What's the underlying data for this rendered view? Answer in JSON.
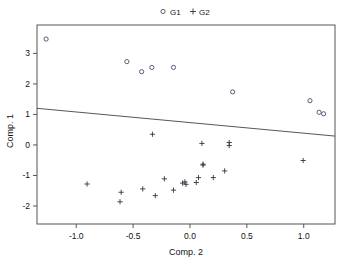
{
  "chart_data": {
    "type": "scatter",
    "title": "",
    "xlabel": "Comp. 2",
    "ylabel": "Comp. 1",
    "xlim": [
      -1.345,
      1.275
    ],
    "ylim": [
      -2.59,
      3.93
    ],
    "xticks": [
      -1.0,
      -0.5,
      0.0,
      0.5,
      1.0
    ],
    "xticklabels": [
      "-1.0",
      "-0.5",
      "0.0",
      "0.5",
      "1.0"
    ],
    "yticks": [
      -2,
      -1,
      0,
      1,
      2,
      3
    ],
    "yticklabels": [
      "-2",
      "-1",
      "0",
      "1",
      "2",
      "3"
    ],
    "grid": false,
    "legend_position": "top",
    "legend": [
      {
        "label": "G1",
        "marker": "circle"
      },
      {
        "label": "G2",
        "marker": "plus"
      }
    ],
    "series": [
      {
        "name": "G1",
        "marker": "circle",
        "points": [
          {
            "x": -1.265,
            "y": 3.47
          },
          {
            "x": -0.555,
            "y": 2.73
          },
          {
            "x": -0.425,
            "y": 2.4
          },
          {
            "x": -0.335,
            "y": 2.54
          },
          {
            "x": -0.145,
            "y": 2.54
          },
          {
            "x": 0.375,
            "y": 1.74
          },
          {
            "x": 1.055,
            "y": 1.45
          },
          {
            "x": 1.135,
            "y": 1.07
          },
          {
            "x": 1.175,
            "y": 1.02
          }
        ]
      },
      {
        "name": "G2",
        "marker": "plus",
        "points": [
          {
            "x": -0.33,
            "y": 0.35
          },
          {
            "x": 0.105,
            "y": 0.05
          },
          {
            "x": 0.345,
            "y": 0.08
          },
          {
            "x": 0.345,
            "y": -0.02
          },
          {
            "x": 0.995,
            "y": -0.51
          },
          {
            "x": 0.115,
            "y": -0.63
          },
          {
            "x": 0.115,
            "y": -0.66
          },
          {
            "x": 0.305,
            "y": -0.85
          },
          {
            "x": -0.225,
            "y": -1.11
          },
          {
            "x": 0.075,
            "y": -1.07
          },
          {
            "x": 0.205,
            "y": -1.07
          },
          {
            "x": -0.905,
            "y": -1.28
          },
          {
            "x": -0.065,
            "y": -1.25
          },
          {
            "x": -0.035,
            "y": -1.29
          },
          {
            "x": 0.055,
            "y": -1.23
          },
          {
            "x": -0.045,
            "y": -1.21
          },
          {
            "x": -0.605,
            "y": -1.55
          },
          {
            "x": -0.415,
            "y": -1.44
          },
          {
            "x": -0.145,
            "y": -1.48
          },
          {
            "x": -0.305,
            "y": -1.66
          },
          {
            "x": -0.615,
            "y": -1.86
          }
        ]
      }
    ],
    "fit_line": {
      "name": "fit-line",
      "x_start": -1.345,
      "y_start": 1.2,
      "x_end": 1.275,
      "y_end": 0.29
    }
  }
}
